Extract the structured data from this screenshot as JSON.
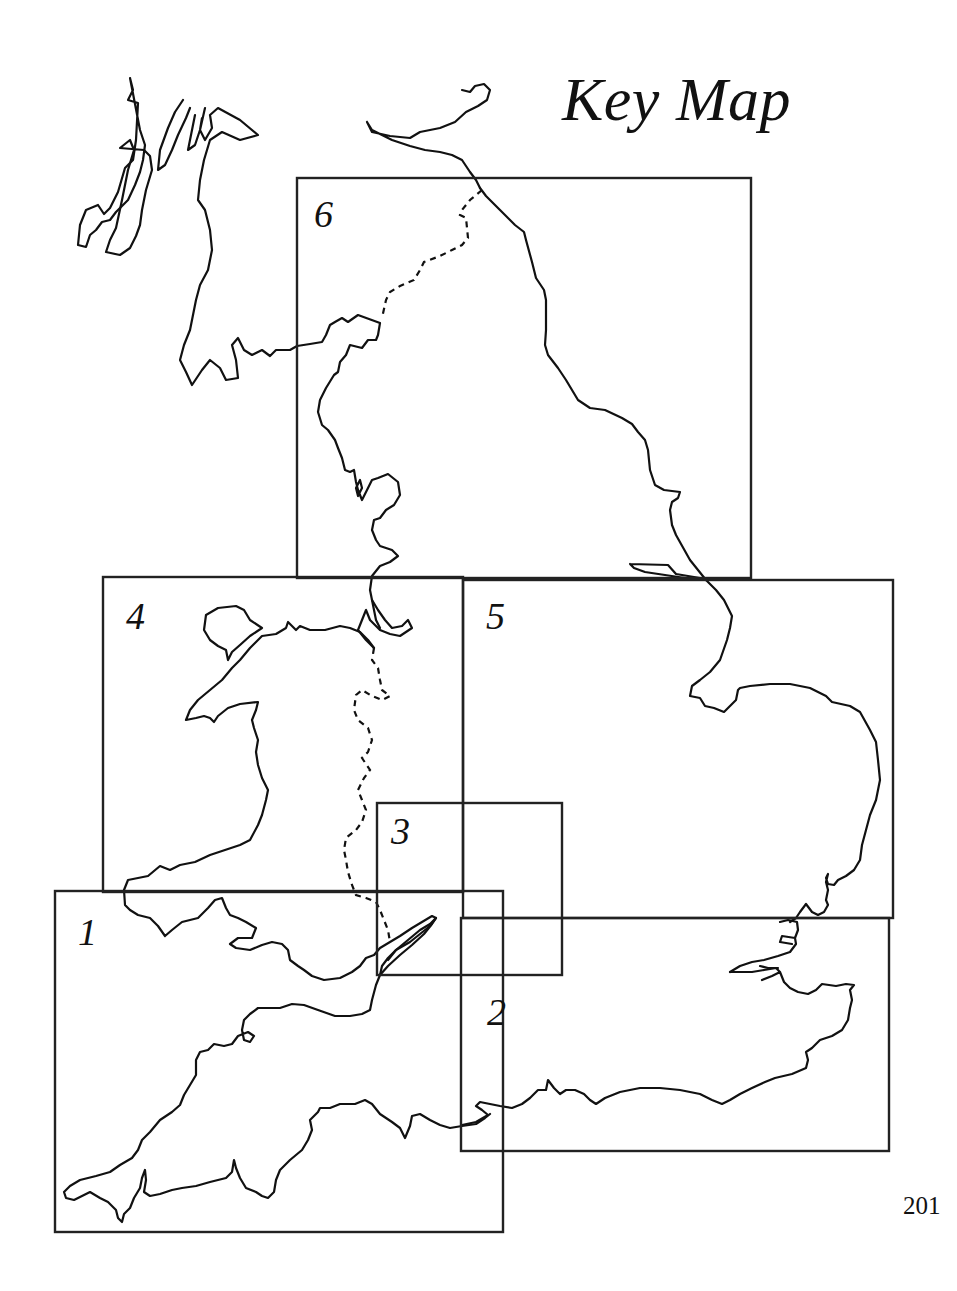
{
  "title": "Key Map",
  "page_number": "201",
  "colors": {
    "ink": "#111111",
    "background": "#ffffff"
  },
  "sheets": [
    {
      "id": "1",
      "label": "1",
      "bounds": {
        "x1": 55,
        "y1": 891,
        "x2": 503,
        "y2": 1232
      },
      "label_pos": {
        "x": 78,
        "y": 913
      }
    },
    {
      "id": "2",
      "label": "2",
      "bounds": {
        "x1": 461,
        "y1": 918,
        "x2": 889,
        "y2": 1151
      },
      "label_pos": {
        "x": 487,
        "y": 993
      }
    },
    {
      "id": "3",
      "label": "3",
      "bounds": {
        "x1": 377,
        "y1": 803,
        "x2": 562,
        "y2": 975
      },
      "label_pos": {
        "x": 391,
        "y": 812
      }
    },
    {
      "id": "4",
      "label": "4",
      "bounds": {
        "x1": 103,
        "y1": 577,
        "x2": 463,
        "y2": 892
      },
      "label_pos": {
        "x": 126,
        "y": 597
      }
    },
    {
      "id": "5",
      "label": "5",
      "bounds": {
        "x1": 463,
        "y1": 580,
        "x2": 893,
        "y2": 918
      },
      "label_pos": {
        "x": 486,
        "y": 597
      }
    },
    {
      "id": "6",
      "label": "6",
      "bounds": {
        "x1": 297,
        "y1": 178,
        "x2": 751,
        "y2": 578
      },
      "label_pos": {
        "x": 314,
        "y": 195
      }
    }
  ],
  "legend": {
    "solid_line": "coastline",
    "dashed_line": "national border"
  }
}
